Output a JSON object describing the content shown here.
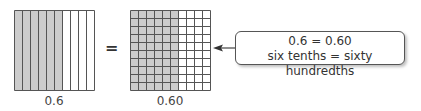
{
  "colors": {
    "shaded": "#cccccc",
    "unshaded": "#ffffff",
    "grid_line": "#555555",
    "text": "#333333"
  },
  "tenths_model": {
    "columns": 10,
    "shaded_columns": 6,
    "label": "0.6"
  },
  "equals_sign": "=",
  "hundredths_model": {
    "rows": 10,
    "columns": 10,
    "shaded_columns": 6,
    "label": "0.60"
  },
  "callout": {
    "line1": "0.6 = 0.60",
    "line2": "six tenths = sixty hundredths",
    "arrow_icon": "arrow-left-icon"
  }
}
